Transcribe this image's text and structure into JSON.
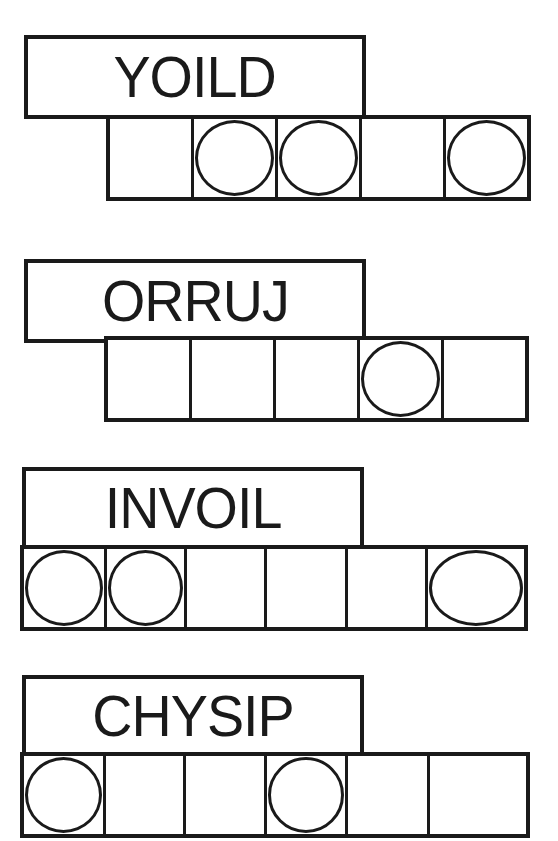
{
  "puzzles": [
    {
      "scrambled": "YOILD",
      "cell_count": 5,
      "circled": [
        false,
        true,
        true,
        false,
        true
      ],
      "answer": [
        "",
        "",
        "",
        "",
        ""
      ]
    },
    {
      "scrambled": "ORRUJ",
      "cell_count": 5,
      "circled": [
        false,
        false,
        false,
        true,
        false
      ],
      "answer": [
        "",
        "",
        "",
        "",
        ""
      ]
    },
    {
      "scrambled": "INVOIL",
      "cell_count": 6,
      "circled": [
        true,
        true,
        false,
        false,
        false,
        true
      ],
      "answer": [
        "",
        "",
        "",
        "",
        "",
        ""
      ]
    },
    {
      "scrambled": "CHYSIP",
      "cell_count": 6,
      "circled": [
        true,
        false,
        false,
        true,
        false,
        false
      ],
      "answer": [
        "",
        "",
        "",
        "",
        "",
        ""
      ]
    }
  ],
  "colors": {
    "ink": "#1a1a1a",
    "background": "#ffffff"
  }
}
